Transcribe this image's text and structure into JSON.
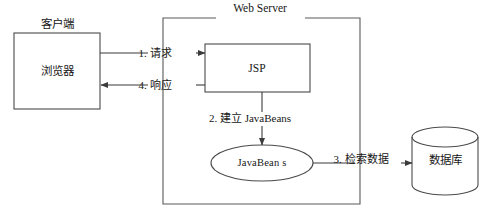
{
  "diagram": {
    "title": "Web Server",
    "nodes": {
      "client_group_label": "客户端",
      "browser": "浏览器",
      "jsp": "JSP",
      "javabeans": "JavaBean s",
      "database": "数据库"
    },
    "flows": [
      {
        "id": "flow-1",
        "label": "1. 请求"
      },
      {
        "id": "flow-4",
        "label": "4. 响应"
      },
      {
        "id": "flow-2",
        "label": "2. 建立 JavaBeans"
      },
      {
        "id": "flow-3",
        "label": "3. 检索数据"
      }
    ],
    "colors": {
      "stroke": "#4a4a4a",
      "text": "#171717",
      "background": "#ffffff"
    }
  }
}
